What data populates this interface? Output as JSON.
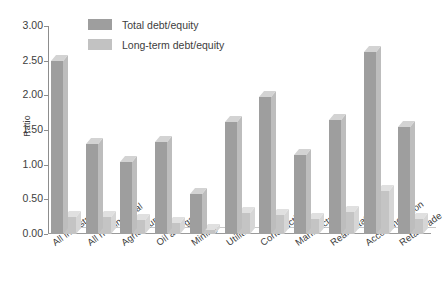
{
  "chart_data": {
    "type": "bar",
    "title": "",
    "xlabel": "",
    "ylabel": "Ratio",
    "ylim": [
      0.0,
      3.0
    ],
    "ytick_labels": [
      "3.00",
      "2.50",
      "2.00",
      "1.50",
      "1.00",
      "0.50",
      "0.00"
    ],
    "ytick_values": [
      3.0,
      2.5,
      2.0,
      1.5,
      1.0,
      0.5,
      0.0
    ],
    "grid": false,
    "legend_position": "top-center",
    "categories": [
      "All industries",
      "All nonfinancial",
      "Agriculture",
      "Oil and gas",
      "Mining",
      "Utilities",
      "Construction",
      "Manufacturing",
      "Real estate",
      "Accommodation",
      "Retail trade"
    ],
    "series": [
      {
        "name": "Total debt/equity",
        "color": "#9e9e9e",
        "values": [
          2.5,
          1.3,
          1.04,
          1.32,
          0.58,
          1.61,
          1.98,
          1.14,
          1.65,
          2.62,
          1.55
        ]
      },
      {
        "name": "Long-term debt/equity",
        "color": "#c2c2c2",
        "values": [
          0.25,
          0.25,
          0.2,
          0.16,
          0.06,
          0.3,
          0.28,
          0.22,
          0.32,
          0.62,
          0.22
        ]
      }
    ]
  },
  "legend": {
    "items": [
      {
        "label": "Total debt/equity",
        "swatch": "#9e9e9e"
      },
      {
        "label": "Long-term debt/equity",
        "swatch": "#c2c2c2"
      }
    ]
  },
  "colors": {
    "series1_front": "#9e9e9e",
    "series1_top": "#d3d3d3",
    "series1_side": "#bdbdbd",
    "series2_front": "#c4c4c4",
    "series2_top": "#e0e0e0",
    "series2_side": "#d6d6d6",
    "axis": "#8d8d8d",
    "text": "#3d3d3d",
    "background": "#ffffff"
  }
}
